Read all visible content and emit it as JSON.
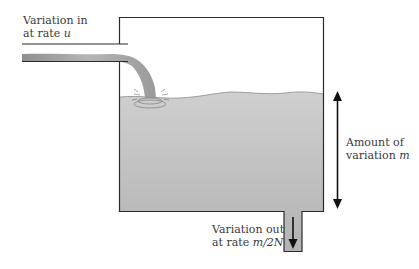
{
  "diagram": {
    "type": "tank-flow",
    "inflow_label": {
      "line1": "Variation in",
      "line2_prefix": "at rate ",
      "line2_var": "u"
    },
    "amount_label": {
      "line1": "Amount of",
      "line2_prefix": "variation ",
      "line2_var": "m"
    },
    "outflow_label": {
      "line1": "Variation out",
      "line2_prefix": "at rate ",
      "line2_var": "m/2N"
    },
    "colors": {
      "outline": "#2b2b2b",
      "water": "#bdbdbd",
      "water_dark": "#a9a9a9",
      "stream": "#a0a0a0",
      "arrow": "#111111",
      "text": "#3a3a3a",
      "background": "#ffffff"
    }
  }
}
